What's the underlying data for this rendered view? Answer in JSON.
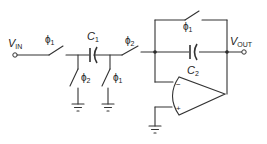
{
  "diagram": {
    "labels": {
      "vin": "V",
      "vin_sub": "IN",
      "vout": "V",
      "vout_sub": "OUT",
      "c1": "C",
      "c1_sub": "1",
      "c2": "C",
      "c2_sub": "2",
      "phi": "ϕ",
      "sub1": "1",
      "sub2": "2",
      "minus": "−",
      "plus": "+"
    },
    "switches": [
      {
        "id": "s-in",
        "phase": "ϕ1",
        "position": "series input"
      },
      {
        "id": "s-shunt-left",
        "phase": "ϕ2",
        "position": "C1 left plate to ground"
      },
      {
        "id": "s-shunt-right",
        "phase": "ϕ1",
        "position": "C1 right plate to ground"
      },
      {
        "id": "s-series-out",
        "phase": "ϕ2",
        "position": "C1 to op-amp inverting input"
      },
      {
        "id": "s-reset",
        "phase": "ϕ1",
        "position": "feedback reset across C2"
      }
    ],
    "components": [
      "C1",
      "C2",
      "op-amp",
      "ground x3"
    ],
    "colors": {
      "ink": "#333333",
      "background": "#ffffff"
    }
  }
}
